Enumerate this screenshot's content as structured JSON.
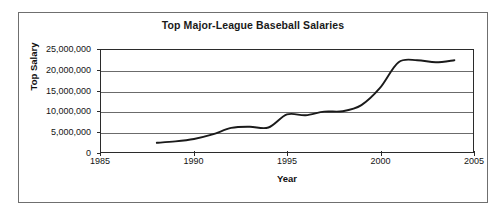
{
  "chart_data": {
    "type": "line",
    "title": "Top Major-League Baseball Salaries",
    "xlabel": "Year",
    "ylabel": "Top Salary",
    "xlim": [
      1985,
      2005
    ],
    "ylim": [
      0,
      25000000
    ],
    "grid": true,
    "legend": "none",
    "xticks": [
      1985,
      1990,
      1995,
      2000,
      2005
    ],
    "xtick_labels": [
      "1985",
      "1990",
      "1995",
      "2000",
      "2005"
    ],
    "yticks": [
      0,
      5000000,
      10000000,
      15000000,
      20000000,
      25000000
    ],
    "ytick_labels": [
      "0",
      "5,000,000",
      "10,000,000",
      "15,000,000",
      "20,000,000",
      "25,000,000"
    ],
    "series": [
      {
        "name": "Top Salary",
        "color": "#1a1a1a",
        "x": [
          1988,
          1989,
          1990,
          1991,
          1992,
          1993,
          1994,
          1995,
          1996,
          1997,
          1998,
          1999,
          2000,
          2001,
          2002,
          2003,
          2004
        ],
        "values": [
          2250000,
          2600000,
          3200000,
          4300000,
          5900000,
          6200000,
          6000000,
          9200000,
          9000000,
          9900000,
          10000000,
          11500000,
          15700000,
          22000000,
          22500000,
          22000000,
          22500000
        ]
      }
    ]
  }
}
